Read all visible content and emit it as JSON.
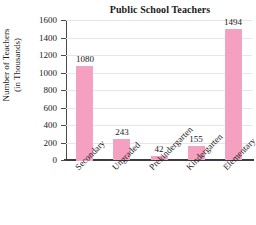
{
  "chart_data": {
    "type": "bar",
    "title": "Public School Teachers",
    "xlabel": "",
    "ylabel": "Number of Teachers (in Thousands)",
    "ylabel_line1": "Number of Teachers",
    "ylabel_line2": "(in Thousands)",
    "categories": [
      "Secondary",
      "Ungraded",
      "Prekindergarten",
      "Kindergarten",
      "Elementary"
    ],
    "values": [
      1080,
      243,
      42,
      155,
      1494
    ],
    "value_labels": [
      "1080",
      "243",
      "42",
      "155",
      "1494"
    ],
    "ylim": [
      0,
      1600
    ],
    "ytick_values": [
      1600,
      1400,
      1200,
      1000,
      800,
      600,
      400,
      200,
      0
    ],
    "ytick_labels": [
      "1600",
      "1400",
      "1200",
      "1000",
      "800",
      "600",
      "400",
      "200",
      "0"
    ],
    "grid": true,
    "legend": "none",
    "bar_color": "#f5a0c0",
    "gridline_color": "#e6e6ea",
    "axis_color": "#3b3b44",
    "background_color": "#ffffff"
  }
}
